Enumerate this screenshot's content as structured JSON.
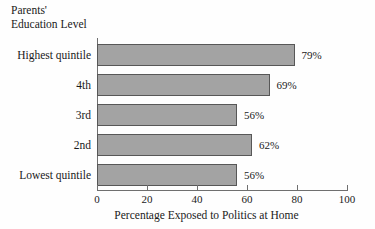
{
  "chart_data": {
    "type": "bar",
    "orientation": "horizontal",
    "title": "",
    "categories": [
      "Highest quintile",
      "4th",
      "3rd",
      "2nd",
      "Lowest quintile"
    ],
    "values": [
      79,
      69,
      56,
      62,
      56
    ],
    "value_labels": [
      "79%",
      "69%",
      "56%",
      "62%",
      "56%"
    ],
    "xlabel": "Percentage Exposed to Politics at Home",
    "ylabel": "Parents'\nEducation Level",
    "xlim": [
      0,
      100
    ],
    "xticks": [
      0,
      20,
      40,
      60,
      80,
      100
    ],
    "xtick_labels": [
      "0",
      "20",
      "40",
      "60",
      "80",
      "100"
    ],
    "grid": false,
    "legend": false,
    "bar_color": "#a3a3a3",
    "bar_edge_color": "#575757",
    "axis_color": "#6f6f6f",
    "background": "#fefefe"
  }
}
